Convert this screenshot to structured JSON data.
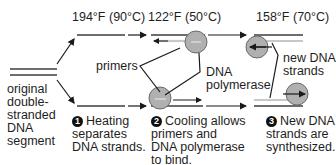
{
  "temperatures": {
    "step1": "194°F (90°C)",
    "step2": "122°F (50°C)",
    "step3": "158°F (70°C)"
  },
  "labels": {
    "original": "original\ndouble-\nstranded\nDNA\nsegment",
    "primers": "primers",
    "polymerase": "DNA\npolymerase",
    "new_strands": "new DNA\nstrands"
  },
  "steps": [
    {
      "number": "1",
      "text": "Heating\nseparates\nDNA strands."
    },
    {
      "number": "2",
      "text": "Cooling allows\nprimers and\nDNA polymerase\nto bind."
    },
    {
      "number": "3",
      "text": "New DNA\nstrands are\nsynthesized."
    }
  ],
  "colors": {
    "strand_dark": "#6d6d6d",
    "strand_light": "#c8c8c8",
    "circle_fill": "#b0b0b0",
    "circle_stroke": "#6a6a6a",
    "arrow": "#1a1a1a"
  }
}
